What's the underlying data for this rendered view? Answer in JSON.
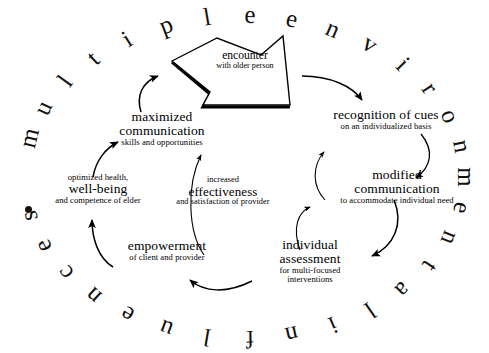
{
  "figure": {
    "title_ring": "multiple environmental influences",
    "ring_bullet": "•",
    "background_color": "#ffffff",
    "ink_color": "#000000"
  },
  "ring": {
    "letters": [
      "m",
      "u",
      "l",
      "t",
      "i",
      "p",
      "l",
      "e",
      "e",
      "n",
      "v",
      "i",
      "r",
      "o",
      "n",
      "m",
      "e",
      "n",
      "t",
      "a",
      "l",
      "i",
      "n",
      "f",
      "l",
      "u",
      "e",
      "n",
      "c",
      "e",
      "s"
    ],
    "words": [
      "multiple",
      "environmental",
      "influences"
    ]
  },
  "center_shape": {
    "name": "starburst",
    "label_big": "encounter",
    "label_small": "with older person"
  },
  "nodes": [
    {
      "id": "encounter",
      "big": "encounter",
      "small": "with older person",
      "small2": ""
    },
    {
      "id": "recognition",
      "big": "recognition of cues",
      "small": "on an individualized basis",
      "small2": ""
    },
    {
      "id": "modified",
      "big1": "modified",
      "big2": "communication",
      "small": "to accommodate individual need",
      "small2": ""
    },
    {
      "id": "assessment",
      "big1": "individual",
      "big2": "assessment",
      "small": "for multi-focused",
      "small2": "interventions"
    },
    {
      "id": "empowerment",
      "big": "empowerment",
      "small": "of client and provider",
      "small2": ""
    },
    {
      "id": "wellbeing",
      "pre": "optimized health,",
      "big": "well-being",
      "small": "and competence of elder",
      "small2": ""
    },
    {
      "id": "maximized",
      "big1": "maximized",
      "big2": "communication",
      "small": "skills and opportunities",
      "small2": ""
    },
    {
      "id": "effectiveness",
      "pre": "increased",
      "big": "effectiveness",
      "small": "and satisfaction of provider",
      "small2": ""
    }
  ],
  "arrows": [
    {
      "id": "maximized-to-encounter",
      "from": "maximized communication",
      "to": "encounter"
    },
    {
      "id": "encounter-to-recognition",
      "from": "encounter",
      "to": "recognition of cues"
    },
    {
      "id": "recognition-to-modified",
      "from": "recognition of cues",
      "to": "modified communication"
    },
    {
      "id": "modified-to-assessment",
      "from": "modified communication",
      "to": "individual assessment"
    },
    {
      "id": "assessment-to-modified",
      "from": "individual assessment",
      "to": "modified communication"
    },
    {
      "id": "assessment-to-empowerment",
      "from": "individual assessment",
      "to": "empowerment"
    },
    {
      "id": "empowerment-to-wellbeing",
      "from": "empowerment",
      "to": "well-being"
    },
    {
      "id": "wellbeing-to-maximized",
      "from": "well-being",
      "to": "maximized communication"
    },
    {
      "id": "empowerment-to-maximized-inner",
      "from": "empowerment",
      "to": "maximized communication"
    },
    {
      "id": "modified-to-recognition-inner",
      "from": "modified communication",
      "to": "recognition of cues"
    }
  ]
}
